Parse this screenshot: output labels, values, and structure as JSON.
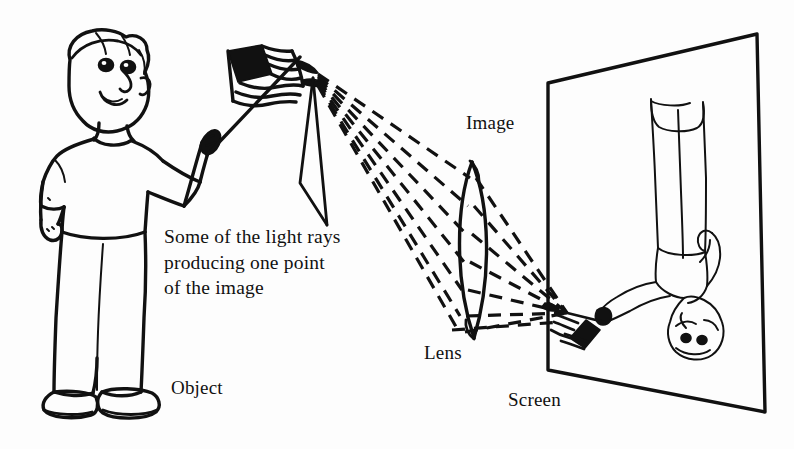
{
  "figure": {
    "line_color": "#111111",
    "background_color": "#fdfdfd"
  },
  "labels": {
    "rays_caption": "Some of the light rays\nproducing one point\nof the image",
    "image": "Image",
    "lens": "Lens",
    "object": "Object",
    "screen": "Screen"
  },
  "diagram_parts": {
    "object_figure": "boy-holding-flag",
    "image_figure": "inverted-boy-holding-flag",
    "optical_element": "biconvex-lens",
    "projection_surface": "screen-rectangle",
    "ray_style": "dashed",
    "ray_count": 7
  }
}
